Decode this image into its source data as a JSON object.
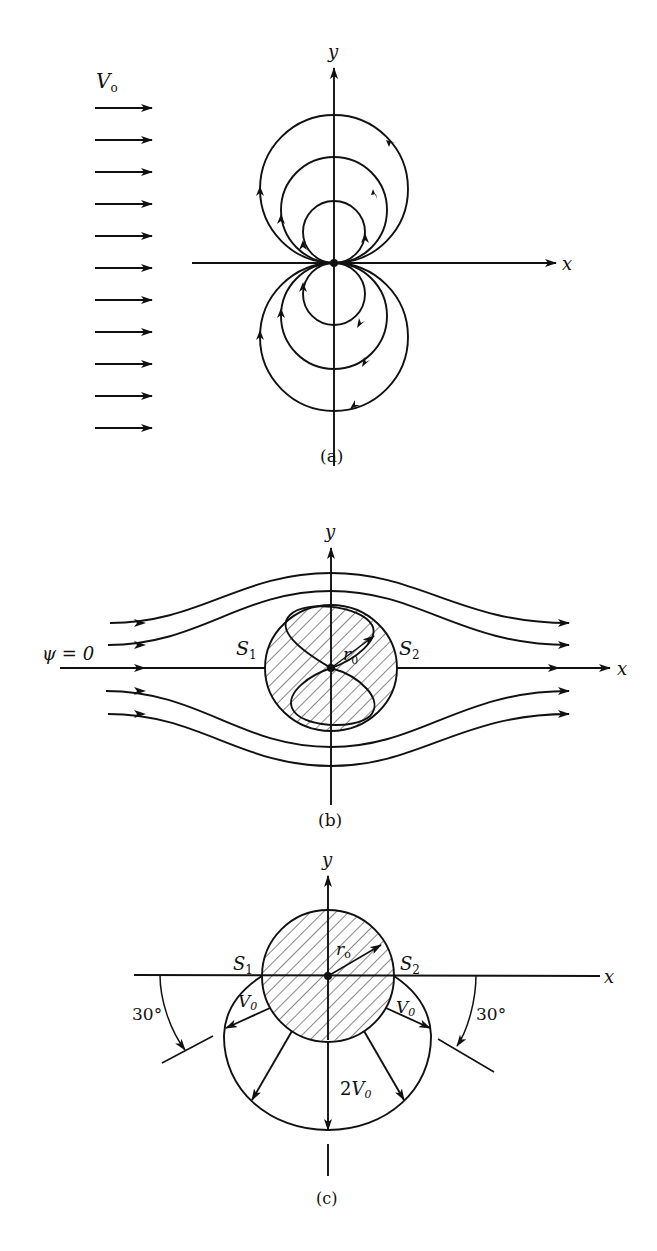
{
  "figure": {
    "panels": [
      {
        "id": "a",
        "caption": "(a)",
        "stream_label": "V",
        "stream_label_sub": "o",
        "x_axis_label": "x",
        "y_axis_label": "y",
        "uniform_arrow_count": 11,
        "doublet_loops": 3
      },
      {
        "id": "b",
        "caption": "(b)",
        "psi_label": "ψ = 0",
        "s1_label": "S",
        "s1_sub": "1",
        "s2_label": "S",
        "s2_sub": "2",
        "radius_label": "r",
        "radius_sub": "0",
        "x_axis_label": "x",
        "y_axis_label": "y"
      },
      {
        "id": "c",
        "caption": "(c)",
        "s1_label": "S",
        "s1_sub": "1",
        "s2_label": "S",
        "s2_sub": "2",
        "radius_label": "r",
        "radius_sub": "o",
        "v0_left": "V",
        "v0_left_sub": "0",
        "v0_right": "V",
        "v0_right_sub": "0",
        "v_bottom_coef": "2",
        "v_bottom": "V",
        "v_bottom_sub": "0",
        "angle_left": "30°",
        "angle_right": "30°",
        "x_axis_label": "x",
        "y_axis_label": "y"
      }
    ]
  }
}
